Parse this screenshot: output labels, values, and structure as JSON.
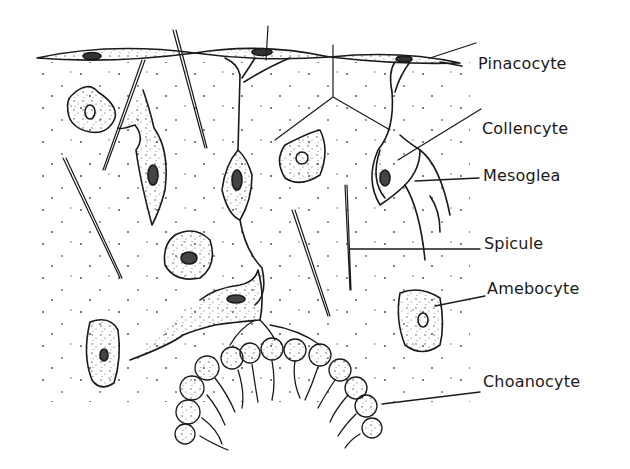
{
  "diagram": {
    "labels": [
      {
        "id": "pinacocyte",
        "text": "Pinacocyte",
        "x": 478,
        "y": 54
      },
      {
        "id": "collencyte",
        "text": "Collencyte",
        "x": 482,
        "y": 119
      },
      {
        "id": "mesoglea",
        "text": "Mesoglea",
        "x": 483,
        "y": 166
      },
      {
        "id": "spicule",
        "text": "Spicule",
        "x": 484,
        "y": 234
      },
      {
        "id": "amebocyte",
        "text": "Amebocyte",
        "x": 487,
        "y": 279
      },
      {
        "id": "choanocyte",
        "text": "Choanocyte",
        "x": 483,
        "y": 372
      }
    ],
    "colors": {
      "ink": "#1a1a1a",
      "background": "#ffffff",
      "stipple": "#555555"
    }
  }
}
